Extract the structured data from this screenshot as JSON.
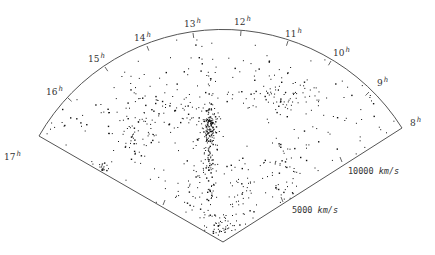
{
  "chart_data": {
    "type": "scatter",
    "title": "",
    "subtitle": "",
    "projection": "polar wedge (redshift-survey cone diagram)",
    "apex": [
      223,
      242
    ],
    "radius_px": 212,
    "outer_velocity_kms": 12000,
    "angular_axis": {
      "label": "Right Ascension",
      "ticks": [
        {
          "label": "17",
          "sup": "h",
          "tick": [
            39,
            136
          ],
          "text": [
            4,
            160
          ]
        },
        {
          "label": "16",
          "sup": "h",
          "tick": [
            68,
            98
          ],
          "text": [
            46,
            95
          ]
        },
        {
          "label": "15",
          "sup": "h",
          "tick": [
            105,
            67
          ],
          "text": [
            88,
            62
          ]
        },
        {
          "label": "14",
          "sup": "h",
          "tick": [
            147,
            46
          ],
          "text": [
            134,
            41
          ]
        },
        {
          "label": "13",
          "sup": "h",
          "tick": [
            193,
            33
          ],
          "text": [
            184,
            27
          ]
        },
        {
          "label": "12",
          "sup": "h",
          "tick": [
            241,
            31
          ],
          "text": [
            234,
            25
          ]
        },
        {
          "label": "11",
          "sup": "h",
          "tick": [
            288,
            41
          ],
          "text": [
            285,
            37
          ]
        },
        {
          "label": "10",
          "sup": "h",
          "tick": [
            331,
            61
          ],
          "text": [
            333,
            56
          ]
        },
        {
          "label": "9",
          "sup": "h",
          "tick": [
            369,
            92
          ],
          "text": [
            377,
            86
          ]
        },
        {
          "label": "8",
          "sup": "h",
          "tick": [
            402,
            128
          ],
          "text": [
            410,
            126
          ]
        }
      ]
    },
    "radial_axis": {
      "label": "Velocity",
      "unit": "km/s",
      "ticks": [
        {
          "value": 5000,
          "label": "5000",
          "right_tick": [
            283,
            202
          ],
          "left_tick": [
            163,
            205
          ],
          "text": [
            292,
            213
          ]
        },
        {
          "value": 10000,
          "label": "10000",
          "right_tick": [
            342,
            162
          ],
          "left_tick": [
            101,
            168
          ],
          "text": [
            348,
            174
          ]
        }
      ]
    },
    "grid": false,
    "legend": null,
    "structures": [
      {
        "name": "Coma finger of god",
        "center": [
          209,
          143
        ],
        "spread": [
          3,
          28
        ],
        "count": 150
      },
      {
        "name": "Coma core",
        "center": [
          210,
          125
        ],
        "spread": [
          5,
          7
        ],
        "count": 60
      },
      {
        "name": "Great Wall arm right",
        "center": [
          275,
          92
        ],
        "spread": [
          22,
          14
        ],
        "count": 90
      },
      {
        "name": "Great Wall arm left",
        "center": [
          160,
          110
        ],
        "spread": [
          28,
          12
        ],
        "count": 80
      },
      {
        "name": "left cluster",
        "center": [
          133,
          139
        ],
        "spread": [
          12,
          10
        ],
        "count": 45
      },
      {
        "name": "stick figure legs left",
        "center": [
          195,
          185
        ],
        "spread": [
          10,
          22
        ],
        "count": 55
      },
      {
        "name": "stick figure legs right",
        "center": [
          240,
          183
        ],
        "spread": [
          8,
          18
        ],
        "count": 40
      },
      {
        "name": "near apex clump",
        "center": [
          222,
          225
        ],
        "spread": [
          10,
          8
        ],
        "count": 55
      },
      {
        "name": "right lower filament",
        "center": [
          285,
          165
        ],
        "spread": [
          16,
          18
        ],
        "count": 55
      },
      {
        "name": "left edge group",
        "center": [
          95,
          170
        ],
        "spread": [
          8,
          4
        ],
        "count": 18
      },
      {
        "name": "upper sparse",
        "center": [
          210,
          75
        ],
        "spread": [
          55,
          20
        ],
        "count": 35
      },
      {
        "name": "far right sparse",
        "center": [
          345,
          115
        ],
        "spread": [
          30,
          20
        ],
        "count": 25
      },
      {
        "name": "far left sparse",
        "center": [
          85,
          120
        ],
        "spread": [
          28,
          18
        ],
        "count": 22
      }
    ]
  }
}
